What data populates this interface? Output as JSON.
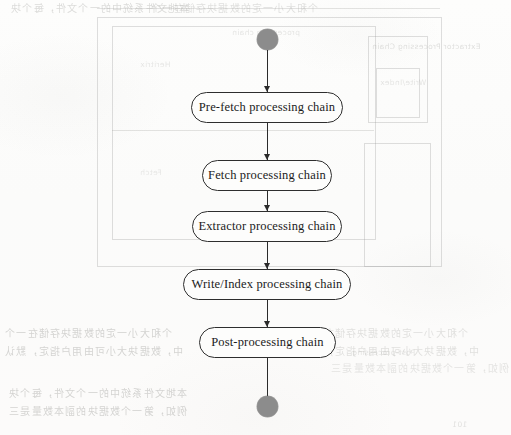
{
  "diagram": {
    "type": "uml-activity-diagram",
    "orientation": "vertical",
    "colors": {
      "node_border": "#2e2e2e",
      "node_fill": "#fdfdfc",
      "terminator_fill": "#8c8c8c",
      "connector": "#2b2b2b",
      "paper": "#fbfbfa",
      "ghost": "#adadaa"
    },
    "start_node": {
      "name": "start",
      "shape": "filled-circle"
    },
    "end_node": {
      "name": "end",
      "shape": "filled-circle"
    },
    "nodes": [
      {
        "label": "Pre-fetch processing chain"
      },
      {
        "label": "Fetch processing chain"
      },
      {
        "label": "Extractor processing chain"
      },
      {
        "label": "Write/Index processing chain"
      },
      {
        "label": "Post-processing chain"
      }
    ],
    "edges": [
      {
        "from": "start",
        "to": "Pre-fetch processing chain"
      },
      {
        "from": "Pre-fetch processing chain",
        "to": "Fetch processing chain"
      },
      {
        "from": "Fetch processing chain",
        "to": "Extractor processing chain"
      },
      {
        "from": "Extractor processing chain",
        "to": "Write/Index processing chain"
      },
      {
        "from": "Write/Index processing chain",
        "to": "Post-processing chain"
      },
      {
        "from": "Post-processing chain",
        "to": "end"
      }
    ]
  },
  "background": {
    "description": "Faint mirrored bleed-through from the reverse side of the scanned book page",
    "cjk_lines": [
      "个和大小一定的数据块存储在一个",
      "中，数据块大小可由用户指定，默认",
      "本地文件系统中的一个文件，每个块",
      "例如，第一个数据块的副本数量是三"
    ],
    "latin_lines": [
      "processing chain",
      "Extractor Processing Chain",
      "Heritrix",
      "Fetch",
      "Write/Index",
      "Post-processing"
    ],
    "page_number": "101"
  }
}
